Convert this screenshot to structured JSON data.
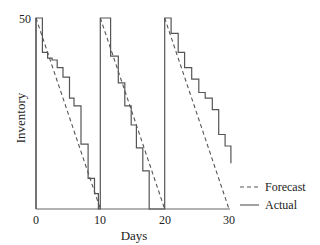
{
  "chart_data": {
    "type": "line",
    "title": "",
    "xlabel": "Days",
    "ylabel": "Inventory",
    "xlim": [
      0,
      30
    ],
    "ylim": [
      0,
      50
    ],
    "x_ticks": [
      "0",
      "10",
      "20",
      "30"
    ],
    "y_ticks": [
      "50"
    ],
    "grid": false,
    "legend_position": "right-bottom",
    "legend": [
      {
        "name": "Forecast",
        "style": "dashed"
      },
      {
        "name": "Actual",
        "style": "solid"
      }
    ],
    "series": [
      {
        "name": "Forecast",
        "style": "dashed",
        "points": [
          [
            0,
            50
          ],
          [
            10,
            0
          ],
          [
            10,
            50
          ],
          [
            20,
            0
          ],
          [
            20,
            50
          ],
          [
            30,
            0
          ]
        ]
      },
      {
        "name": "Actual",
        "style": "solid",
        "step": true,
        "points": [
          [
            0,
            0
          ],
          [
            0,
            50
          ],
          [
            1,
            50
          ],
          [
            1,
            41
          ],
          [
            1.8,
            41
          ],
          [
            1.8,
            39.5
          ],
          [
            2.5,
            39.5
          ],
          [
            2.5,
            39
          ],
          [
            3.3,
            39
          ],
          [
            3.3,
            37
          ],
          [
            4.2,
            37
          ],
          [
            4.2,
            34.5
          ],
          [
            5.2,
            34.5
          ],
          [
            5.2,
            29
          ],
          [
            5.9,
            29
          ],
          [
            5.9,
            27
          ],
          [
            7,
            27
          ],
          [
            7,
            17
          ],
          [
            8.1,
            17
          ],
          [
            8.1,
            8
          ],
          [
            9.1,
            8
          ],
          [
            9.1,
            4
          ],
          [
            9.7,
            4
          ],
          [
            9.7,
            0
          ],
          [
            10,
            0
          ],
          [
            10,
            50
          ],
          [
            11.6,
            50
          ],
          [
            11.6,
            40
          ],
          [
            12.8,
            40
          ],
          [
            12.8,
            33
          ],
          [
            13.8,
            33
          ],
          [
            13.8,
            27
          ],
          [
            14.8,
            27
          ],
          [
            14.8,
            22
          ],
          [
            15.6,
            22
          ],
          [
            15.6,
            16
          ],
          [
            16.6,
            16
          ],
          [
            16.6,
            10
          ],
          [
            17.6,
            10
          ],
          [
            17.6,
            0
          ],
          [
            20,
            0
          ],
          [
            20,
            50
          ],
          [
            21,
            50
          ],
          [
            21,
            46
          ],
          [
            22.1,
            46
          ],
          [
            22.1,
            41
          ],
          [
            23.1,
            41
          ],
          [
            23.1,
            37
          ],
          [
            24.2,
            37
          ],
          [
            24.2,
            34
          ],
          [
            25.3,
            34
          ],
          [
            25.3,
            30.5
          ],
          [
            26.3,
            30.5
          ],
          [
            26.3,
            29
          ],
          [
            27.4,
            29
          ],
          [
            27.4,
            26
          ],
          [
            28.4,
            26
          ],
          [
            28.4,
            19.5
          ],
          [
            29.4,
            19.5
          ],
          [
            29.4,
            16.5
          ],
          [
            30.3,
            16.5
          ],
          [
            30.3,
            12
          ]
        ]
      }
    ]
  },
  "axes": {
    "xlabel": "Days",
    "ylabel": "Inventory",
    "x_ticks": [
      "0",
      "10",
      "20",
      "30"
    ],
    "y_top_tick": "50"
  },
  "legend": {
    "forecast": "Forecast",
    "actual": "Actual"
  },
  "colors": {
    "line": "#555555",
    "text": "#222222"
  }
}
